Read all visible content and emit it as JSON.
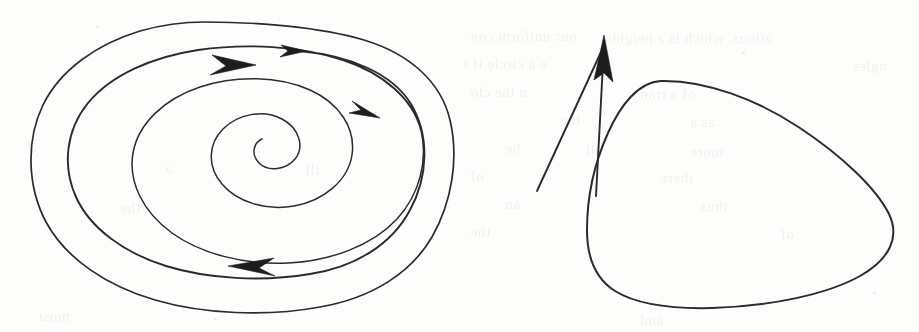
{
  "page": {
    "width": 919,
    "height": 332,
    "background_color": "#fdfdfc",
    "ink_color": "#2b2b2b",
    "media": "scanned-book-page",
    "caption": ""
  },
  "figures": [
    {
      "id": "left-figure",
      "name": "spiral-approaching-limit-cycle",
      "description": "An inward spiral trajectory winding clockwise-in toward a focus, drawn with three arrowheads indicating direction of flow, enclosed by a larger closed oval orbit.",
      "elements": [
        {
          "name": "outer-closed-orbit",
          "kind": "curve",
          "closed": false,
          "note": "outermost oval, open at top where the line begins"
        },
        {
          "name": "spiral-trajectory",
          "kind": "curve",
          "closed": false,
          "note": "spiral winding inward to a central focus point"
        },
        {
          "name": "arrowhead-outer-top",
          "kind": "arrowhead",
          "direction": "right",
          "size": "small"
        },
        {
          "name": "arrowhead-spiral-top",
          "kind": "arrowhead",
          "direction": "right",
          "size": "large"
        },
        {
          "name": "arrowhead-spiral-right",
          "kind": "arrowhead",
          "direction": "right-down",
          "size": "small"
        },
        {
          "name": "arrowhead-spiral-bottom",
          "kind": "arrowhead",
          "direction": "left",
          "size": "large"
        }
      ]
    },
    {
      "id": "right-figure",
      "name": "closed-orbit-with-transversal-arrow",
      "description": "A single smooth closed convex curve shaped like a rounded triangle, crossed near its upper-left by a straight arrow pointing up and slightly right.",
      "elements": [
        {
          "name": "closed-orbit-curve",
          "kind": "curve",
          "closed": true
        },
        {
          "name": "transversal-arrow",
          "kind": "arrow",
          "direction": "up",
          "note": "straight segment crossing the closed curve, arrowhead at top"
        }
      ]
    }
  ],
  "bleed_text": {
    "note": "faint mirrored show-through text from the reverse page; illegible in the scan",
    "lines": [
      {
        "text": "our uniform con",
        "x": 470,
        "y": 28
      },
      {
        "text": "ations, which is a neighbo",
        "x": 600,
        "y": 30
      },
      {
        "text": "e a circle if t",
        "x": 463,
        "y": 56
      },
      {
        "text": "ngles",
        "x": 852,
        "y": 58
      },
      {
        "text": "n the clo",
        "x": 470,
        "y": 84
      },
      {
        "text": "of a tran",
        "x": 640,
        "y": 86
      },
      {
        "text": "the",
        "x": 560,
        "y": 112
      },
      {
        "text": "as a",
        "x": 690,
        "y": 114
      },
      {
        "text": "be",
        "x": 505,
        "y": 140
      },
      {
        "text": "all",
        "x": 585,
        "y": 142
      },
      {
        "text": "more",
        "x": 690,
        "y": 144
      },
      {
        "text": "of",
        "x": 470,
        "y": 168
      },
      {
        "text": "there",
        "x": 660,
        "y": 170
      },
      {
        "text": "an",
        "x": 505,
        "y": 196
      },
      {
        "text": "thus",
        "x": 700,
        "y": 198
      },
      {
        "text": "the",
        "x": 470,
        "y": 224
      },
      {
        "text": "of",
        "x": 780,
        "y": 226
      },
      {
        "text": "a",
        "x": 165,
        "y": 160
      },
      {
        "text": "tll",
        "x": 305,
        "y": 162
      },
      {
        "text": "the",
        "x": 120,
        "y": 200
      },
      {
        "text": "most",
        "x": 38,
        "y": 308
      },
      {
        "text": "and",
        "x": 640,
        "y": 312
      }
    ]
  }
}
